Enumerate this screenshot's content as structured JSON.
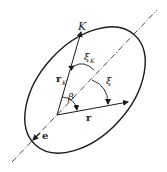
{
  "diagram": {
    "labels": {
      "point_K": "K",
      "vector_rK": "r",
      "vector_rK_sub": "K",
      "vector_r": "r",
      "angle_xiK": "ξ",
      "angle_xiK_sub": "K",
      "angle_xi": "ξ",
      "angle_beta": "β",
      "unit_vector_e": "e"
    },
    "colors": {
      "stroke": "#1a1a1a",
      "background": "#ffffff"
    }
  }
}
